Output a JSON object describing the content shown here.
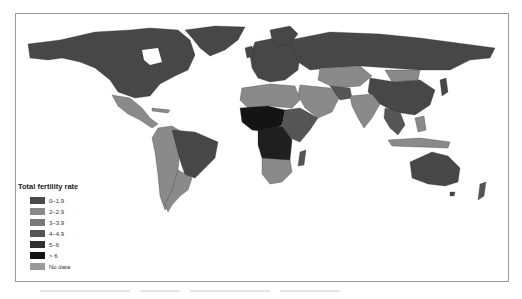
{
  "map": {
    "type": "choropleth world map",
    "projection": "equirectangular-like world projection",
    "legend": {
      "title": "Total fertility rate",
      "items": [
        {
          "label": "0–1.9",
          "color": "#4a4a4a"
        },
        {
          "label": "2–2.9",
          "color": "#8a8a8a"
        },
        {
          "label": "3–3.9",
          "color": "#7a7a7a"
        },
        {
          "label": "4–4.9",
          "color": "#555555"
        },
        {
          "label": "5–6",
          "color": "#303030"
        },
        {
          "label": "> 6",
          "color": "#141414"
        },
        {
          "label": "No data",
          "color": "#9a9a9a"
        }
      ]
    },
    "regions": [
      {
        "name": "North America (USA, Canada)",
        "class": "0–1.9"
      },
      {
        "name": "Greenland",
        "class": "0–1.9"
      },
      {
        "name": "Mexico / Central America",
        "class": "2–2.9"
      },
      {
        "name": "Brazil",
        "class": "0–1.9"
      },
      {
        "name": "Andean South America",
        "class": "2–2.9"
      },
      {
        "name": "Europe",
        "class": "0–1.9"
      },
      {
        "name": "Russia",
        "class": "0–1.9"
      },
      {
        "name": "Central Asia / Mongolia",
        "class": "2–2.9"
      },
      {
        "name": "China / East Asia",
        "class": "0–1.9"
      },
      {
        "name": "India / South Asia",
        "class": "2–2.9"
      },
      {
        "name": "Middle East",
        "class": "2–2.9"
      },
      {
        "name": "North Africa",
        "class": "2–2.9"
      },
      {
        "name": "Sahel / West Africa",
        "class": "> 6"
      },
      {
        "name": "Central Africa",
        "class": "5–6"
      },
      {
        "name": "East Africa",
        "class": "4–4.9"
      },
      {
        "name": "Southern Africa",
        "class": "2–2.9"
      },
      {
        "name": "Madagascar",
        "class": "4–4.9"
      },
      {
        "name": "Southeast Asia",
        "class": "2–2.9"
      },
      {
        "name": "Australia",
        "class": "0–1.9"
      },
      {
        "name": "New Zealand",
        "class": "0–1.9"
      }
    ]
  }
}
